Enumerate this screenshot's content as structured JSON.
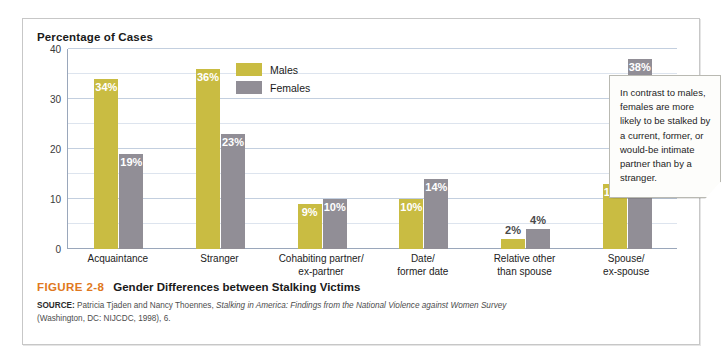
{
  "figure": {
    "number": "FIGURE 2-8",
    "title": "Gender Differences between Stalking Victims",
    "source_label": "SOURCE:",
    "source_text_1": "Patricia Tjaden and Nancy Thoennes,",
    "source_text_italic_1": "Stalking in America: Findings from the National Violence against",
    "source_text_italic_2": "Women Survey",
    "source_text_2": "(Washington, DC: NIJCDC, 1998), 6."
  },
  "callout": {
    "text": "In contrast to males, females are more likely to be stalked by a current, former, or would-be intimate partner than by a stranger."
  },
  "colors": {
    "males": "#c9bc42",
    "females": "#918e96",
    "figure_number": "#e07820",
    "gridline": "#c3cfdf",
    "axis": "#9aa7bb"
  },
  "chart_data": {
    "type": "bar",
    "title": "Percentage of Cases",
    "xlabel": "",
    "ylabel": "Percentage of Cases",
    "ylim": [
      0,
      40
    ],
    "yticks": [
      0,
      10,
      20,
      30,
      40
    ],
    "ytick_labels": [
      "0",
      "10",
      "20",
      "30",
      "40"
    ],
    "minor_gridlines": [
      5,
      15,
      25,
      35
    ],
    "grid": true,
    "legend_position": "inside-top-center",
    "categories": [
      "Acquaintance",
      "Stranger",
      "Cohabiting partner/\nex-partner",
      "Date/\nformer date",
      "Relative other\nthan spouse",
      "Spouse/\nex-spouse"
    ],
    "category_lines": [
      [
        "Acquaintance"
      ],
      [
        "Stranger"
      ],
      [
        "Cohabiting partner/",
        "ex-partner"
      ],
      [
        "Date/",
        "former date"
      ],
      [
        "Relative other",
        "than spouse"
      ],
      [
        "Spouse/",
        "ex-spouse"
      ]
    ],
    "series": [
      {
        "name": "Males",
        "color": "#c9bc42",
        "values": [
          34,
          36,
          9,
          10,
          2,
          13
        ],
        "labels": [
          "34%",
          "36%",
          "9%",
          "10%",
          "2%",
          "13%"
        ]
      },
      {
        "name": "Females",
        "color": "#918e96",
        "values": [
          19,
          23,
          10,
          14,
          4,
          38
        ],
        "labels": [
          "19%",
          "23%",
          "10%",
          "14%",
          "4%",
          "38%"
        ]
      }
    ]
  }
}
